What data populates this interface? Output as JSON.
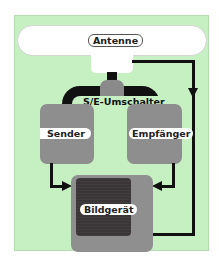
{
  "diagram": {
    "nodes": {
      "antenna": {
        "label": "Antenne"
      },
      "switch": {
        "label": "S/E-Umschalter"
      },
      "sender": {
        "label": "Sender"
      },
      "receiver": {
        "label": "Empfänger"
      },
      "display": {
        "label": "Bildgerät"
      }
    },
    "edges": [
      {
        "from": "antenna",
        "to": "switch"
      },
      {
        "from": "switch",
        "to": "sender"
      },
      {
        "from": "switch",
        "to": "receiver"
      },
      {
        "from": "sender",
        "to": "display"
      },
      {
        "from": "receiver",
        "to": "display"
      },
      {
        "from": "antenna",
        "to": "display",
        "via": "right-side-line"
      }
    ],
    "colors": {
      "background": "#c6efc2",
      "block": "#8e8e8e",
      "display_screen": "#3a3537",
      "connector": "#111111"
    }
  }
}
